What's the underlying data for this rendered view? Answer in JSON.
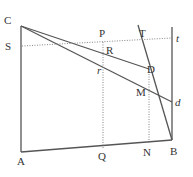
{
  "diagram": {
    "type": "geometric-figure",
    "stroke_color": "#555555",
    "dotted_color": "#777777",
    "labels": {
      "C": "C",
      "S": "S",
      "A": "A",
      "P": "P",
      "R": "R",
      "r": "r",
      "T": "T",
      "t": "t",
      "D": "D",
      "M": "M",
      "d": "d",
      "Q": "Q",
      "N": "N",
      "B": "B"
    },
    "points": {
      "C": [
        21,
        26
      ],
      "A": [
        21,
        152
      ],
      "B": [
        172,
        140
      ],
      "S": [
        21,
        46
      ],
      "P": [
        103,
        42
      ],
      "Q": [
        103,
        148
      ],
      "D": [
        149,
        69
      ],
      "N": [
        149,
        143
      ],
      "T": [
        138,
        25
      ],
      "t_top": [
        172,
        27
      ],
      "d": [
        172,
        102
      ],
      "M": [
        149,
        93
      ]
    },
    "solid_segments": [
      [
        "C",
        "A"
      ],
      [
        "A",
        "B"
      ],
      [
        "C",
        "D"
      ],
      [
        "C",
        "d"
      ],
      [
        "T",
        "B"
      ],
      [
        "t_top",
        "B"
      ]
    ],
    "dotted_segments": [
      [
        "S",
        "t"
      ],
      [
        "P",
        "Q"
      ],
      [
        "D",
        "N"
      ]
    ]
  }
}
